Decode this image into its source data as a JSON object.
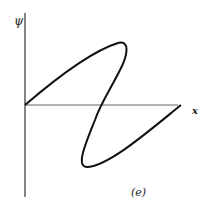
{
  "figure": {
    "y_axis_label": "ψ",
    "x_axis_label": "x",
    "caption": "(e)",
    "colors": {
      "curve": "#111111",
      "axes": "#333333",
      "background": "#ffffff"
    }
  }
}
